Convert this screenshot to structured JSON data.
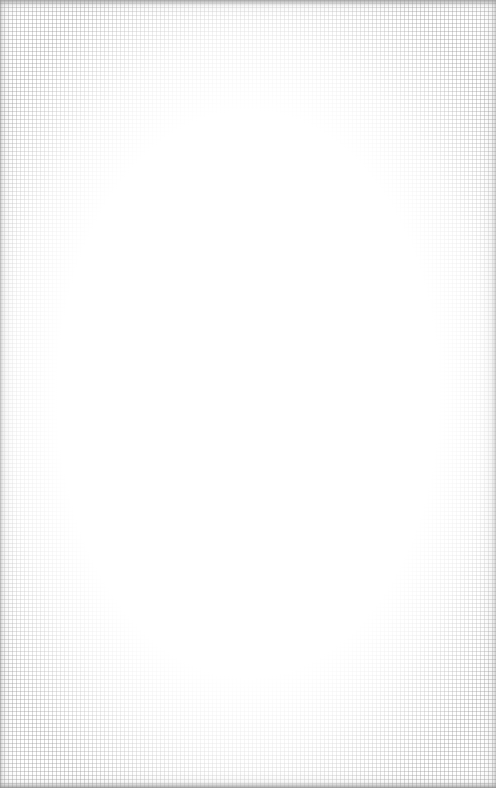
{
  "canvas": {
    "description": "blank textured paper/linen surface",
    "background_color": "#ffffff",
    "texture_color": "#969696",
    "vignette_color": "#a0a0a0"
  }
}
